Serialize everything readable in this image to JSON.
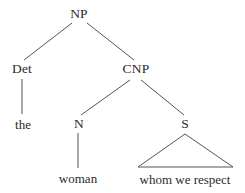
{
  "figure": {
    "type": "syntax-tree",
    "background_color": "#ffffff",
    "line_color": "#555555",
    "text_color": "#2b2b2b"
  },
  "nodes": {
    "np": {
      "label": "NP",
      "x": 79,
      "y": 14
    },
    "det": {
      "label": "Det",
      "x": 22,
      "y": 69
    },
    "cnp": {
      "label": "CNP",
      "x": 136,
      "y": 69
    },
    "the": {
      "label": "the",
      "x": 23,
      "y": 124
    },
    "n": {
      "label": "N",
      "x": 79,
      "y": 124
    },
    "s": {
      "label": "S",
      "x": 185,
      "y": 124
    },
    "woman": {
      "label": "woman",
      "x": 78,
      "y": 178
    },
    "clause": {
      "label": "whom we respect",
      "x": 185,
      "y": 179
    }
  },
  "edges": [
    {
      "name": "np-to-det",
      "x1": 72,
      "y1": 23,
      "x2": 24,
      "y2": 60
    },
    {
      "name": "np-to-cnp",
      "x1": 87,
      "y1": 23,
      "x2": 134,
      "y2": 60
    },
    {
      "name": "det-to-the",
      "x1": 22,
      "y1": 79,
      "x2": 22,
      "y2": 114
    },
    {
      "name": "cnp-to-n",
      "x1": 130,
      "y1": 80,
      "x2": 81,
      "y2": 115
    },
    {
      "name": "cnp-to-s",
      "x1": 141,
      "y1": 80,
      "x2": 184,
      "y2": 115
    },
    {
      "name": "n-to-woman",
      "x1": 78,
      "y1": 133,
      "x2": 78,
      "y2": 168
    }
  ],
  "triangle": {
    "name": "s-triangle",
    "apex_x": 185,
    "apex_y": 134,
    "left_x": 138,
    "left_y": 167,
    "right_x": 233,
    "right_y": 167
  }
}
